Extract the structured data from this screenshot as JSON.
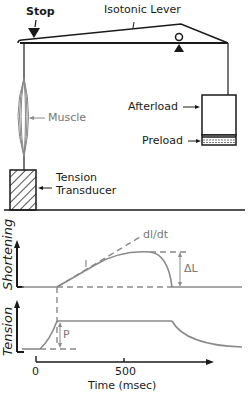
{
  "apparatus": {
    "stop_label": "Stop",
    "lever_label": "Isotonic Lever",
    "muscle_label": "Muscle",
    "afterload_label": "Afterload",
    "preload_label": "Preload",
    "transducer_label_1": "Tension",
    "transducer_label_2": "Transducer"
  },
  "traces": {
    "shortening_axis": "Shortening",
    "tension_axis": "Tension",
    "slope_label": "dl/dt",
    "delta_l_label": "ΔL",
    "preload_p_label": "P",
    "x_axis_label": "Time (msec)",
    "x_ticks": [
      "0",
      "500"
    ]
  },
  "colors": {
    "ink": "#1a1a1a",
    "trace": "#8a8a8a",
    "muscle": "#888888"
  }
}
